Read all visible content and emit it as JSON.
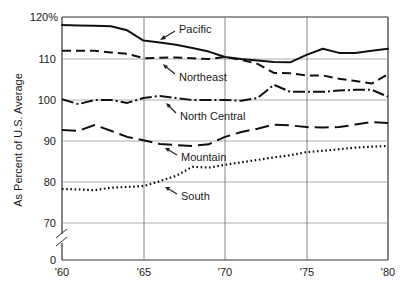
{
  "chart_data": {
    "type": "line",
    "title": "",
    "xlabel": "",
    "ylabel": "As Percent of U.S. Average",
    "x_ticks": [
      "'60",
      "'65",
      "'70",
      "'75",
      "'80"
    ],
    "y_ticks": [
      "120%",
      "110",
      "100",
      "90",
      "80",
      "70",
      "0"
    ],
    "y_break": "between 0 and 70",
    "xlim": [
      1960,
      1980
    ],
    "ylim": [
      0,
      120
    ],
    "grid": true,
    "legend_position": "inline labels with arrows",
    "x": [
      1960,
      1961,
      1962,
      1963,
      1964,
      1965,
      1966,
      1967,
      1968,
      1969,
      1970,
      1971,
      1972,
      1973,
      1974,
      1975,
      1976,
      1977,
      1978,
      1979,
      1980
    ],
    "series": [
      {
        "name": "Pacific",
        "style": "solid",
        "values": [
          118.3,
          118.2,
          118.1,
          118.0,
          117.0,
          114.5,
          114.0,
          113.5,
          112.7,
          111.8,
          110.5,
          110.0,
          109.6,
          109.3,
          109.2,
          111.0,
          112.5,
          111.5,
          111.5,
          112.0,
          112.5
        ]
      },
      {
        "name": "Northeast",
        "style": "dashed",
        "values": [
          112.0,
          112.0,
          112.0,
          111.6,
          111.3,
          110.2,
          110.3,
          110.4,
          110.2,
          110.0,
          110.5,
          109.8,
          108.8,
          106.6,
          106.5,
          106.0,
          106.0,
          105.2,
          104.6,
          104.0,
          106.3
        ]
      },
      {
        "name": "North Central",
        "style": "dash-dot",
        "values": [
          100.2,
          99.0,
          100.0,
          100.0,
          99.3,
          100.5,
          101.0,
          100.5,
          100.0,
          100.0,
          100.0,
          99.8,
          100.5,
          103.7,
          102.0,
          102.0,
          102.0,
          102.3,
          102.5,
          102.5,
          100.8
        ]
      },
      {
        "name": "Mountain",
        "style": "long-dash",
        "values": [
          92.7,
          92.5,
          93.9,
          92.5,
          91.0,
          90.2,
          89.3,
          89.0,
          88.8,
          89.2,
          91.0,
          92.2,
          93.0,
          94.0,
          93.8,
          93.4,
          93.3,
          93.4,
          94.0,
          94.6,
          94.4
        ]
      },
      {
        "name": "South",
        "style": "dotted",
        "values": [
          78.3,
          78.2,
          78.0,
          78.6,
          78.8,
          79.0,
          80.2,
          81.5,
          83.7,
          83.5,
          84.2,
          84.8,
          85.4,
          86.0,
          86.5,
          87.3,
          87.6,
          88.0,
          88.4,
          88.6,
          88.8
        ]
      }
    ]
  },
  "labels": {
    "pacific": "Pacific",
    "northeast": "Northeast",
    "north_central": "North Central",
    "mountain": "Mountain",
    "south": "South"
  },
  "axis": {
    "ylabel": "As Percent of U.S. Average",
    "y_ticks": [
      "120%",
      "110",
      "100",
      "90",
      "80",
      "70",
      "0"
    ],
    "x_ticks": [
      "'60",
      "'65",
      "'70",
      "'75",
      "'80"
    ]
  }
}
